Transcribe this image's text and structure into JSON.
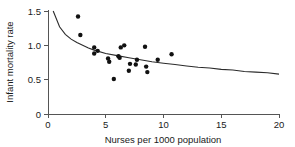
{
  "chart_data": {
    "type": "scatter",
    "title": "",
    "xlabel": "Nurses per 1000 population",
    "ylabel": "Infant mortality rate",
    "xlim": [
      0,
      20
    ],
    "ylim": [
      0,
      1.5
    ],
    "xticks": [
      0,
      5,
      10,
      15,
      20
    ],
    "xtick_labels": [
      "0",
      "5",
      "10",
      "15",
      "20"
    ],
    "yticks": [
      0,
      0.5,
      1.0,
      1.5
    ],
    "ytick_labels": [
      "0",
      "0.5",
      "1.0",
      "1.5"
    ],
    "grid": false,
    "legend": false,
    "series": [
      {
        "name": "observations",
        "marker": "filled-circle",
        "color": "#111111",
        "points": [
          {
            "x": 2.6,
            "y": 1.42
          },
          {
            "x": 2.8,
            "y": 1.15
          },
          {
            "x": 4.0,
            "y": 0.97
          },
          {
            "x": 4.0,
            "y": 0.88
          },
          {
            "x": 4.3,
            "y": 0.92
          },
          {
            "x": 5.2,
            "y": 0.81
          },
          {
            "x": 5.3,
            "y": 0.76
          },
          {
            "x": 5.7,
            "y": 0.51
          },
          {
            "x": 6.1,
            "y": 0.84
          },
          {
            "x": 6.2,
            "y": 0.82
          },
          {
            "x": 6.3,
            "y": 0.97
          },
          {
            "x": 6.6,
            "y": 1.0
          },
          {
            "x": 7.0,
            "y": 0.63
          },
          {
            "x": 7.1,
            "y": 0.73
          },
          {
            "x": 7.6,
            "y": 0.72
          },
          {
            "x": 7.7,
            "y": 0.79
          },
          {
            "x": 8.4,
            "y": 0.98
          },
          {
            "x": 8.5,
            "y": 0.69
          },
          {
            "x": 8.6,
            "y": 0.61
          },
          {
            "x": 9.5,
            "y": 0.79
          },
          {
            "x": 10.7,
            "y": 0.87
          }
        ]
      },
      {
        "name": "fitted-curve",
        "marker": "line",
        "color": "#2b2b2b",
        "points": [
          {
            "x": 0.45,
            "y": 1.5
          },
          {
            "x": 1.0,
            "y": 1.27
          },
          {
            "x": 1.5,
            "y": 1.16
          },
          {
            "x": 2.0,
            "y": 1.09
          },
          {
            "x": 2.5,
            "y": 1.04
          },
          {
            "x": 3.0,
            "y": 1.0
          },
          {
            "x": 3.5,
            "y": 0.96
          },
          {
            "x": 4.0,
            "y": 0.93
          },
          {
            "x": 5.0,
            "y": 0.88
          },
          {
            "x": 6.0,
            "y": 0.85
          },
          {
            "x": 7.0,
            "y": 0.82
          },
          {
            "x": 8.0,
            "y": 0.79
          },
          {
            "x": 9.0,
            "y": 0.76
          },
          {
            "x": 10.0,
            "y": 0.74
          },
          {
            "x": 11.0,
            "y": 0.72
          },
          {
            "x": 12.0,
            "y": 0.7
          },
          {
            "x": 13.0,
            "y": 0.68
          },
          {
            "x": 14.0,
            "y": 0.67
          },
          {
            "x": 15.0,
            "y": 0.65
          },
          {
            "x": 16.0,
            "y": 0.64
          },
          {
            "x": 17.0,
            "y": 0.62
          },
          {
            "x": 18.0,
            "y": 0.61
          },
          {
            "x": 19.0,
            "y": 0.6
          },
          {
            "x": 20.0,
            "y": 0.58
          }
        ]
      }
    ]
  }
}
